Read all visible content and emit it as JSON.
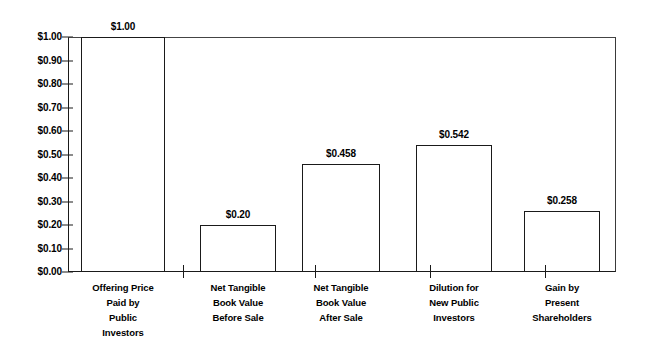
{
  "chart_data": {
    "type": "bar",
    "title": "",
    "subtitle": "",
    "xlabel": "",
    "ylabel": "",
    "ylim": [
      0,
      1.0
    ],
    "grid": false,
    "legend": "none",
    "y_tick_labels": [
      "$1.00",
      "$0.90",
      "$0.80",
      "$0.70",
      "$0.60",
      "$0.50",
      "$0.40",
      "$0.30",
      "$0.20",
      "$0.10",
      "$0.00"
    ],
    "y_tick_values": [
      1.0,
      0.9,
      0.8,
      0.7,
      0.6,
      0.5,
      0.4,
      0.3,
      0.2,
      0.1,
      0.0
    ],
    "categories": [
      "Offering Price Paid by Public Investors",
      "Net Tangible Book Value Before Sale",
      "Net Tangible Book Value After Sale",
      "Dilution for New Public Investors",
      "Gain by Present Shareholders"
    ],
    "category_lines": [
      [
        "Offering Price",
        "Paid by",
        "Public",
        "Investors"
      ],
      [
        "Net Tangible",
        "Book Value",
        "Before Sale"
      ],
      [
        "Net Tangible",
        "Book Value",
        "After Sale"
      ],
      [
        "Dilution for",
        "New Public",
        "Investors"
      ],
      [
        "Gain by",
        "Present",
        "Shareholders"
      ]
    ],
    "values": [
      1.0,
      0.2,
      0.458,
      0.542,
      0.258
    ],
    "value_labels": [
      "$1.00",
      "$0.20",
      "$0.458",
      "$0.542",
      "$0.258"
    ],
    "bar_color": "#ffffff",
    "bar_edge_color": "#1a1a1a",
    "axis_color": "#1a1a1a",
    "text_color": "#000000",
    "background_color": "#ffffff"
  },
  "geometry": {
    "bar_left_px": [
      13,
      132,
      234,
      348,
      456
    ],
    "bar_width_px": [
      84,
      76,
      78,
      76,
      76
    ],
    "x_tick_px": [
      115,
      247,
      362,
      477
    ],
    "label_center_px": [
      55,
      170,
      273,
      386,
      494
    ]
  }
}
